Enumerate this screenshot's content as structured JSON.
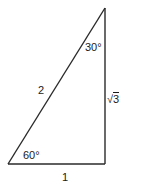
{
  "diagram": {
    "type": "right-triangle",
    "stroke_color": "#2a2a2a",
    "text_color": "#1a1a1a",
    "background": "#ffffff",
    "vertices": {
      "top": [
        105,
        8
      ],
      "bottom_left": [
        8,
        164
      ],
      "bottom_right": [
        105,
        164
      ]
    },
    "angles": {
      "top": "30°",
      "bottom_left": "60°",
      "right_angle_at": "bottom_right"
    },
    "sides": {
      "hypotenuse": "2",
      "vertical_leg_radical": "√",
      "vertical_leg_radicand": "3",
      "horizontal_leg": "1"
    }
  }
}
